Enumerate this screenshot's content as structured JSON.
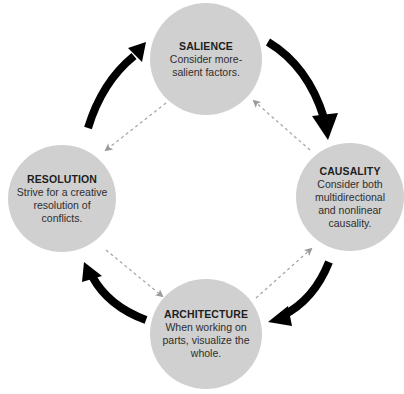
{
  "diagram": {
    "type": "cycle",
    "colors": {
      "node_fill": "#d0d0d0",
      "solid_arrow": "#000000",
      "dashed_arrow": "#a8a8a8",
      "background": "#ffffff"
    },
    "nodes": [
      {
        "id": "salience",
        "title": "SALIENCE",
        "description": "Consider more-salient factors."
      },
      {
        "id": "causality",
        "title": "CAUSALITY",
        "description": "Consider both multidirectional and nonlinear causality."
      },
      {
        "id": "architecture",
        "title": "ARCHITECTURE",
        "description": "When working on parts, visualize the whole."
      },
      {
        "id": "resolution",
        "title": "RESOLUTION",
        "description": "Strive for a creative resolution of conflicts."
      }
    ],
    "edges_solid_clockwise": [
      {
        "from": "salience",
        "to": "causality"
      },
      {
        "from": "causality",
        "to": "architecture"
      },
      {
        "from": "architecture",
        "to": "resolution"
      },
      {
        "from": "resolution",
        "to": "salience"
      }
    ],
    "edges_dashed_counterclockwise": [
      {
        "from": "salience",
        "to": "resolution"
      },
      {
        "from": "resolution",
        "to": "architecture"
      },
      {
        "from": "architecture",
        "to": "causality"
      },
      {
        "from": "causality",
        "to": "salience"
      }
    ]
  }
}
